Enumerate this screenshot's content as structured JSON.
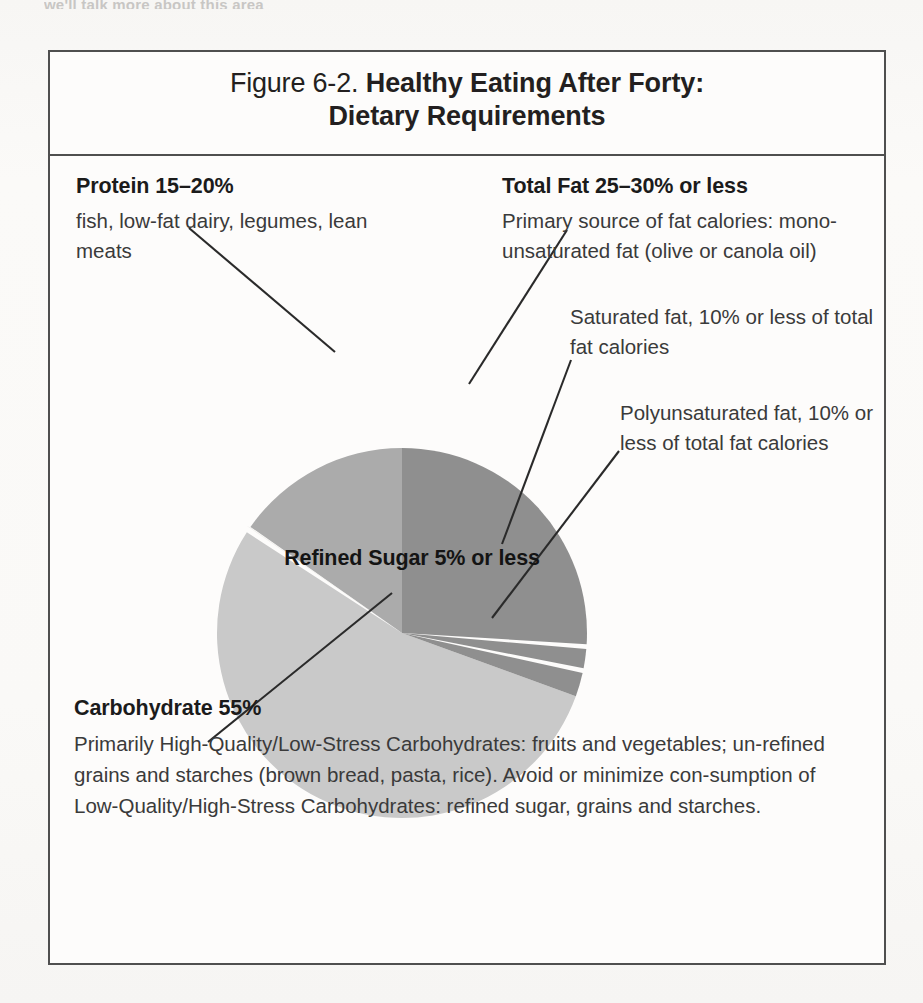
{
  "page": {
    "bleed_text": "we'll talk more about this area"
  },
  "figure": {
    "number": "Figure 6-2.",
    "title_line1": "Healthy Eating After Forty:",
    "title_line2": "Dietary Requirements"
  },
  "annotations": {
    "protein": {
      "heading": "Protein 15–20%",
      "body": "fish, low-fat dairy, legumes, lean meats"
    },
    "total_fat": {
      "heading": "Total Fat 25–30% or less",
      "body": "Primary source of fat calories: mono-unsaturated fat (olive or canola oil)"
    },
    "saturated_fat": {
      "heading": "",
      "body": "Saturated fat, 10% or less of total fat calories"
    },
    "polyunsaturated_fat": {
      "heading": "",
      "body": "Polyunsaturated fat, 10% or less of total fat calories"
    },
    "refined_sugar": {
      "heading": "Refined Sugar 5% or less",
      "body": ""
    },
    "carbohydrate": {
      "heading": "Carbohydrate 55%",
      "body": "Primarily High-Quality/Low-Stress Carbohydrates: fruits and vegetables; un-refined grains and starches (brown bread, pasta, rice). Avoid or minimize con-sumption of Low-Quality/High-Stress Carbohydrates: refined sugar, grains and starches."
    }
  },
  "colors": {
    "total_fat": "#8f8f8f",
    "saturated_fat": "#8f8f8f",
    "polyunsaturated_fat": "#8f8f8f",
    "protein": "#ababab",
    "carbohydrate": "#c9c9c9",
    "divider": "#e8e7e4",
    "border": "#4f4f4f",
    "leader_line": "#2a2a2a",
    "text": "#231f20"
  },
  "chart_data": {
    "type": "pie",
    "title": "Healthy Eating After Forty: Dietary Requirements",
    "legend": "none",
    "labels": [
      "Total Fat",
      "Saturated fat",
      "Polyunsaturated fat",
      "Carbohydrate",
      "Refined Sugar",
      "Protein"
    ],
    "values": [
      25,
      2.5,
      2.5,
      55,
      5,
      17.5
    ],
    "value_labels": [
      "25–30% or less",
      "10% or less of total fat calories",
      "10% or less of total fat calories",
      "55%",
      "5% or less",
      "15–20%"
    ],
    "start_angle_deg": 0,
    "direction": "clockwise",
    "center": [
      400,
      527
    ],
    "radius": 185,
    "slice_angles_deg": [
      {
        "label": "Total Fat",
        "start": 0,
        "end": 93.5,
        "color": "#8f8f8f"
      },
      {
        "label": "Saturated fat",
        "start": 95.0,
        "end": 101.0,
        "color": "#8f8f8f"
      },
      {
        "label": "Polyunsaturated fat",
        "start": 102.5,
        "end": 110.0,
        "color": "#8f8f8f"
      },
      {
        "label": "Carbohydrate",
        "start": 110.0,
        "end": 303.0,
        "color": "#c9c9c9"
      },
      {
        "label": "Protein",
        "start": 305.0,
        "end": 360.0,
        "color": "#ababab"
      }
    ]
  }
}
